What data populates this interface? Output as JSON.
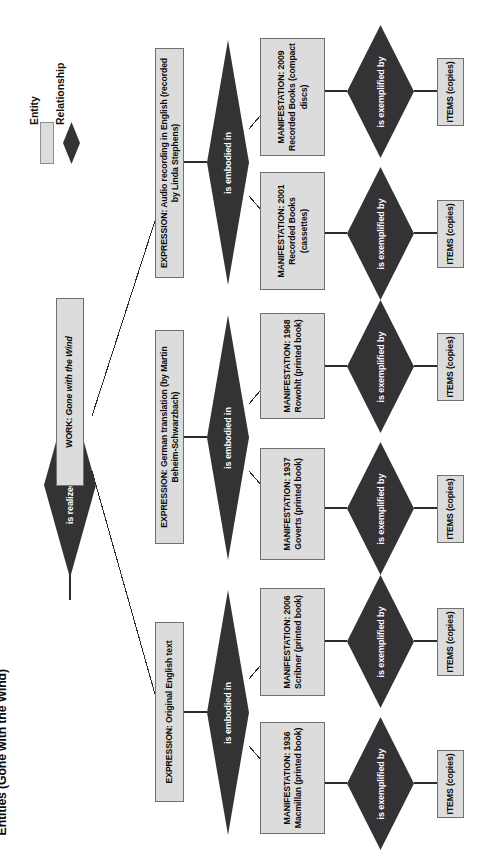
{
  "figure": {
    "title": "Figure 1.2.  Relationship Between FRBR Group 1 Entities (Gone with the Wind)"
  },
  "legend": {
    "entity_label": "Entity",
    "relationship_label": "Relationship"
  },
  "colors": {
    "entity_fill": "#dcdcdc",
    "entity_border": "#6e6e6e",
    "relationship_fill": "#333335",
    "relationship_text": "#ffffff",
    "background": "#ffffff"
  },
  "work": {
    "prefix": "WORK: ",
    "title": "Gone with the Wind",
    "full": "WORK: Gone with the Wind"
  },
  "relationships": {
    "realized": "is realized through",
    "embodied": "is embodied in",
    "exemplified": "is exemplified by"
  },
  "expressions": [
    {
      "id": "expr-original",
      "label": "EXPRESSION: Original English text"
    },
    {
      "id": "expr-german",
      "label": "EXPRESSION: German translation (by Martin Beheim-Schwarzbach)"
    },
    {
      "id": "expr-audio",
      "label": "EXPRESSION: Audio recording in English (recorded by Linda Stephens)"
    }
  ],
  "manifestations": [
    {
      "id": "manif-1936-macmillan",
      "label": "MANIFESTATION: 1936 Macmillan (printed book)"
    },
    {
      "id": "manif-2006-scribner",
      "label": "MANIFESTATION: 2006 Scribner (printed book)"
    },
    {
      "id": "manif-1937-goverts",
      "label": "MANIFESTATION: 1937 Goverts (printed book)"
    },
    {
      "id": "manif-1968-rowohlt",
      "label": "MANIFESTATION: 1968 Rowohlt (printed book)"
    },
    {
      "id": "manif-2001-recorded-books",
      "label": "MANIFESTATION: 2001 Recorded Books (cassettes)"
    },
    {
      "id": "manif-2009-recorded-books",
      "label": "MANIFESTATION: 2009 Recorded Books (compact discs)"
    }
  ],
  "items": [
    {
      "id": "items-1",
      "label": "ITEMS (copies)"
    },
    {
      "id": "items-2",
      "label": "ITEMS (copies)"
    },
    {
      "id": "items-3",
      "label": "ITEMS (copies)"
    },
    {
      "id": "items-4",
      "label": "ITEMS (copies)"
    },
    {
      "id": "items-5",
      "label": "ITEMS (copies)"
    },
    {
      "id": "items-6",
      "label": "ITEMS (copies)"
    }
  ]
}
